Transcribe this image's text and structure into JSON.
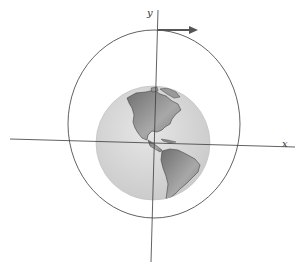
{
  "diagram": {
    "axes": {
      "x_label": "x",
      "y_label": "y"
    },
    "colors": {
      "line": "#3a3a3a",
      "arrow": "#555555",
      "ocean": "#d9d9d9",
      "land": "#8a8a8a",
      "background": "#ffffff"
    },
    "elements": [
      "orbit-circle",
      "earth-globe",
      "x-axis",
      "y-axis",
      "velocity-arrow"
    ]
  }
}
